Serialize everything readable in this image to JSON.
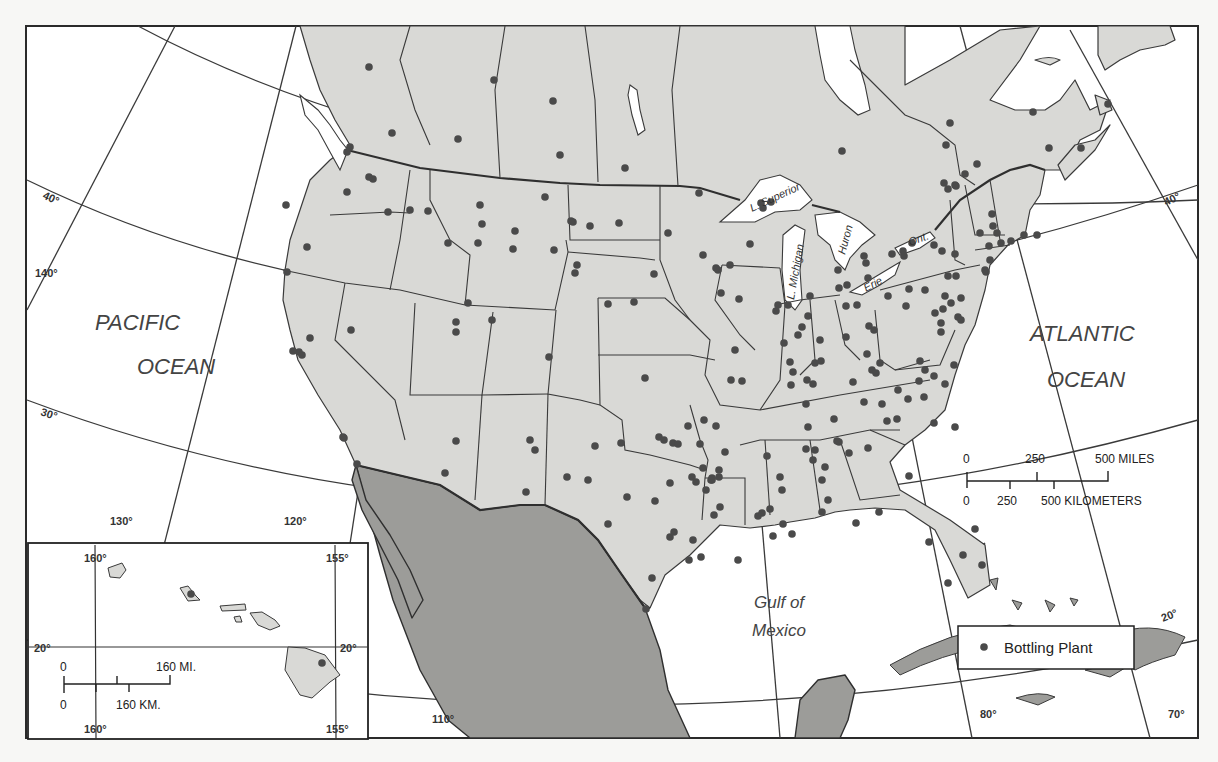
{
  "map": {
    "title": "Bottling Plant Locations - North America",
    "colors": {
      "ocean": "#ffffff",
      "us_canada_land": "#d9d9d6",
      "mexico_caribbean_land": "#9c9c99",
      "plant_dot": "#4a4a4a",
      "lines": "#3a3a3a"
    },
    "labels": {
      "pacific_line1": "PACIFIC",
      "pacific_line2": "OCEAN",
      "atlantic_line1": "ATLANTIC",
      "atlantic_line2": "OCEAN",
      "gulf_line1": "Gulf of",
      "gulf_line2": "Mexico"
    },
    "lakes": {
      "superior": "L. Superior",
      "michigan": "L. Michigan",
      "huron": "Huron",
      "erie": "Erie",
      "ontario": "Ont."
    },
    "graticule": {
      "lat_40_left": "40°",
      "lat_40_right": "40°",
      "lat_30_left": "30°",
      "lat_20_right": "20°",
      "lon_140": "140°",
      "lon_130": "130°",
      "lon_120": "120°",
      "lon_110": "110°",
      "lon_80": "80°",
      "lon_70": "70°"
    },
    "scale_bar": {
      "miles_0": "0",
      "miles_250": "250",
      "miles_500": "500 MILES",
      "km_0": "0",
      "km_250": "250",
      "km_500": "500 KILOMETERS"
    },
    "legend": {
      "items": [
        {
          "symbol": "dot",
          "label": "Bottling Plant"
        }
      ]
    },
    "inset_hawaii": {
      "lon_160_top": "160°",
      "lon_155_top": "155°",
      "lon_160_bottom": "160°",
      "lon_155_bottom": "155°",
      "lat_20_left": "20°",
      "lat_20_right": "20°",
      "scale_mi_0": "0",
      "scale_mi_160": "160 MI.",
      "scale_km_0": "0",
      "scale_km_160": "160 KM.",
      "plants": [
        [
          191,
          594
        ],
        [
          322,
          663
        ]
      ]
    },
    "plants": [
      [
        369,
        67
      ],
      [
        494,
        80
      ],
      [
        553,
        101
      ],
      [
        392,
        133
      ],
      [
        458,
        139
      ],
      [
        560,
        155
      ],
      [
        625,
        168
      ],
      [
        373,
        179
      ],
      [
        350,
        147
      ],
      [
        347,
        152
      ],
      [
        388,
        212
      ],
      [
        410,
        210
      ],
      [
        369,
        177
      ],
      [
        307,
        247
      ],
      [
        286,
        205
      ],
      [
        347,
        192
      ],
      [
        428,
        211
      ],
      [
        448,
        243
      ],
      [
        480,
        205
      ],
      [
        515,
        231
      ],
      [
        545,
        197
      ],
      [
        478,
        243
      ],
      [
        513,
        249
      ],
      [
        573,
        222
      ],
      [
        590,
        226
      ],
      [
        619,
        223
      ],
      [
        668,
        233
      ],
      [
        699,
        193
      ],
      [
        554,
        250
      ],
      [
        575,
        273
      ],
      [
        634,
        302
      ],
      [
        654,
        274
      ],
      [
        608,
        304
      ],
      [
        645,
        378
      ],
      [
        577,
        265
      ],
      [
        468,
        303
      ],
      [
        482,
        224
      ],
      [
        456,
        322
      ],
      [
        456,
        332
      ],
      [
        492,
        320
      ],
      [
        549,
        357
      ],
      [
        571,
        221
      ],
      [
        287,
        272
      ],
      [
        299,
        352
      ],
      [
        293,
        351
      ],
      [
        302,
        355
      ],
      [
        310,
        338
      ],
      [
        351,
        330
      ],
      [
        344,
        438
      ],
      [
        357,
        464
      ],
      [
        343,
        437
      ],
      [
        456,
        441
      ],
      [
        445,
        473
      ],
      [
        530,
        440
      ],
      [
        535,
        450
      ],
      [
        567,
        477
      ],
      [
        526,
        492
      ],
      [
        621,
        443
      ],
      [
        595,
        446
      ],
      [
        588,
        480
      ],
      [
        627,
        497
      ],
      [
        659,
        437
      ],
      [
        664,
        440
      ],
      [
        670,
        483
      ],
      [
        673,
        443
      ],
      [
        678,
        444
      ],
      [
        700,
        444
      ],
      [
        716,
        426
      ],
      [
        714,
        515
      ],
      [
        720,
        507
      ],
      [
        725,
        452
      ],
      [
        692,
        477
      ],
      [
        693,
        540
      ],
      [
        670,
        537
      ],
      [
        674,
        532
      ],
      [
        646,
        609
      ],
      [
        608,
        524
      ],
      [
        652,
        578
      ],
      [
        655,
        501
      ],
      [
        689,
        560
      ],
      [
        701,
        557
      ],
      [
        704,
        420
      ],
      [
        688,
        426
      ],
      [
        711,
        480
      ],
      [
        712,
        478
      ],
      [
        712,
        480
      ],
      [
        719,
        470
      ],
      [
        719,
        477
      ],
      [
        706,
        490
      ],
      [
        735,
        350
      ],
      [
        731,
        380
      ],
      [
        739,
        299
      ],
      [
        742,
        381
      ],
      [
        703,
        255
      ],
      [
        718,
        270
      ],
      [
        730,
        265
      ],
      [
        716,
        268
      ],
      [
        721,
        293
      ],
      [
        750,
        244
      ],
      [
        771,
        202
      ],
      [
        761,
        203
      ],
      [
        776,
        311
      ],
      [
        778,
        305
      ],
      [
        788,
        305
      ],
      [
        784,
        343
      ],
      [
        790,
        362
      ],
      [
        798,
        335
      ],
      [
        806,
        404
      ],
      [
        807,
        380
      ],
      [
        791,
        385
      ],
      [
        813,
        384
      ],
      [
        815,
        450
      ],
      [
        839,
        442
      ],
      [
        834,
        419
      ],
      [
        808,
        427
      ],
      [
        825,
        467
      ],
      [
        822,
        480
      ],
      [
        837,
        441
      ],
      [
        849,
        453
      ],
      [
        806,
        449
      ],
      [
        813,
        460
      ],
      [
        767,
        456
      ],
      [
        780,
        477
      ],
      [
        782,
        490
      ],
      [
        758,
        516
      ],
      [
        773,
        536
      ],
      [
        762,
        513
      ],
      [
        770,
        509
      ],
      [
        822,
        512
      ],
      [
        738,
        560
      ],
      [
        792,
        534
      ],
      [
        828,
        500
      ],
      [
        820,
        340
      ],
      [
        802,
        327
      ],
      [
        793,
        372
      ],
      [
        810,
        296
      ],
      [
        839,
        288
      ],
      [
        846,
        306
      ],
      [
        846,
        337
      ],
      [
        853,
        382
      ],
      [
        821,
        361
      ],
      [
        808,
        316
      ],
      [
        815,
        363
      ],
      [
        838,
        270
      ],
      [
        847,
        285
      ],
      [
        857,
        305
      ],
      [
        867,
        354
      ],
      [
        869,
        326
      ],
      [
        872,
        370
      ],
      [
        874,
        330
      ],
      [
        876,
        373
      ],
      [
        864,
        402
      ],
      [
        882,
        404
      ],
      [
        897,
        419
      ],
      [
        908,
        399
      ],
      [
        924,
        397
      ],
      [
        919,
        381
      ],
      [
        887,
        421
      ],
      [
        909,
        476
      ],
      [
        868,
        448
      ],
      [
        880,
        363
      ],
      [
        898,
        390
      ],
      [
        920,
        361
      ],
      [
        925,
        370
      ],
      [
        934,
        376
      ],
      [
        941,
        332
      ],
      [
        945,
        384
      ],
      [
        934,
        423
      ],
      [
        955,
        427
      ],
      [
        954,
        365
      ],
      [
        906,
        306
      ],
      [
        909,
        289
      ],
      [
        888,
        296
      ],
      [
        925,
        290
      ],
      [
        941,
        323
      ],
      [
        935,
        313
      ],
      [
        945,
        296
      ],
      [
        951,
        303
      ],
      [
        943,
        309
      ],
      [
        958,
        317
      ],
      [
        961,
        320
      ],
      [
        961,
        298
      ],
      [
        948,
        276
      ],
      [
        956,
        276
      ],
      [
        955,
        254
      ],
      [
        942,
        251
      ],
      [
        934,
        245
      ],
      [
        990,
        260
      ],
      [
        986,
        272
      ],
      [
        980,
        233
      ],
      [
        989,
        246
      ],
      [
        997,
        233
      ],
      [
        1001,
        243
      ],
      [
        985,
        270
      ],
      [
        1024,
        235
      ],
      [
        1011,
        241
      ],
      [
        992,
        214
      ],
      [
        993,
        226
      ],
      [
        956,
        186
      ],
      [
        944,
        183
      ],
      [
        948,
        189
      ],
      [
        955,
        185
      ],
      [
        977,
        164
      ],
      [
        965,
        174
      ],
      [
        946,
        145
      ],
      [
        903,
        251
      ],
      [
        904,
        256
      ],
      [
        892,
        254
      ],
      [
        868,
        278
      ],
      [
        866,
        263
      ],
      [
        864,
        256
      ],
      [
        763,
        208
      ],
      [
        912,
        243
      ],
      [
        950,
        123
      ],
      [
        842,
        151
      ],
      [
        1033,
        112
      ],
      [
        1049,
        148
      ],
      [
        1081,
        148
      ],
      [
        1108,
        104
      ],
      [
        1037,
        235
      ],
      [
        975,
        529
      ],
      [
        963,
        555
      ],
      [
        948,
        583
      ],
      [
        982,
        565
      ],
      [
        929,
        542
      ],
      [
        879,
        512
      ],
      [
        856,
        523
      ],
      [
        783,
        524
      ],
      [
        696,
        482
      ],
      [
        703,
        468
      ]
    ]
  }
}
